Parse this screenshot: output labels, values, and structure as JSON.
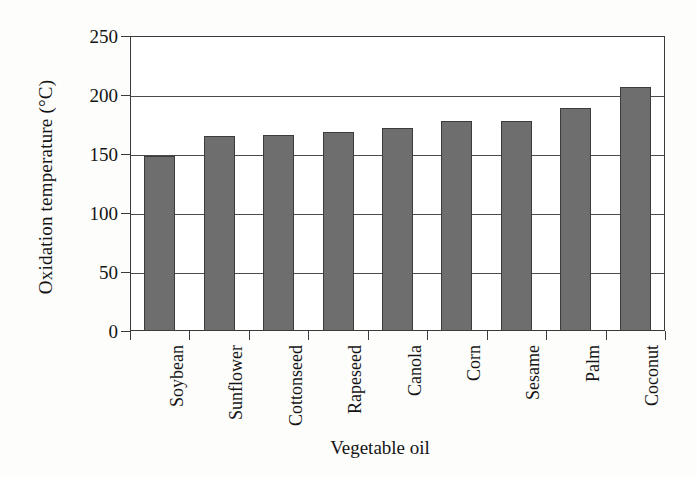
{
  "chart_data": {
    "type": "bar",
    "title": "",
    "xlabel": "Vegetable oil",
    "ylabel": "Oxidation temperature (°C)",
    "categories": [
      "Soybean",
      "Sunflower",
      "Cottonseed",
      "Rapeseed",
      "Canola",
      "Corn",
      "Sesame",
      "Palm",
      "Coconut"
    ],
    "values": [
      148,
      165,
      166,
      169,
      172,
      178,
      178,
      189,
      207
    ],
    "ylim": [
      0,
      250
    ],
    "yticks": [
      0,
      50,
      100,
      150,
      200,
      250
    ],
    "ytick_labels": [
      "0",
      "50",
      "100",
      "150",
      "200",
      "250"
    ],
    "grid": "horizontal",
    "legend": "none",
    "bar_color": "#6e6e6e",
    "bar_edge_color": "#3c3c3c",
    "axis_color": "#3a3a3a",
    "background_color": "#ffffff",
    "units": "°C",
    "series_name": "Oxidation temperature"
  }
}
